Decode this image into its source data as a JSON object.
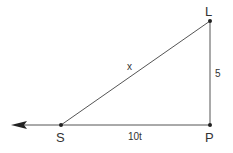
{
  "diagram": {
    "type": "right-triangle",
    "colors": {
      "line": "#555555",
      "text": "#333333",
      "point": "#222222"
    },
    "points": {
      "L": {
        "label": "L"
      },
      "S": {
        "label": "S"
      },
      "P": {
        "label": "P"
      }
    },
    "segments": {
      "hypotenuse": {
        "from": "S",
        "to": "L",
        "label": "x"
      },
      "vertical": {
        "from": "P",
        "to": "L",
        "label": "5"
      },
      "horizontal": {
        "from": "S",
        "to": "P",
        "label": "10t"
      }
    },
    "arrow": {
      "direction": "left",
      "from": "S"
    }
  }
}
